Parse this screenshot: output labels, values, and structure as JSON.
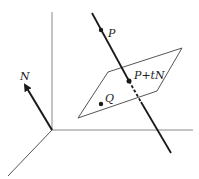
{
  "labels": {
    "p": "P",
    "p_plus_tn": "P+tN",
    "q": "Q",
    "n": "N"
  },
  "colors": {
    "axes": "#8a8a8a",
    "ink": "#1a1a1a",
    "plane": "#555555"
  }
}
